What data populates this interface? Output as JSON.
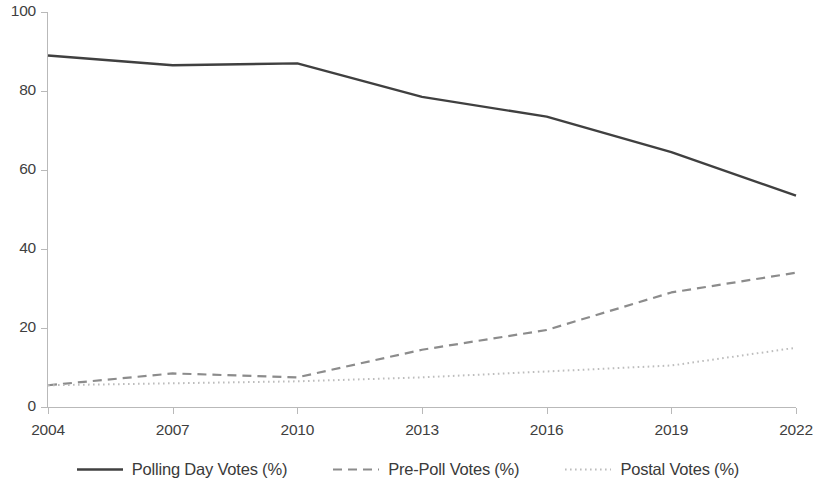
{
  "chart_data": {
    "type": "line",
    "title": "",
    "subtitle": "",
    "xlabel": "",
    "ylabel": "",
    "x": [
      2004,
      2007,
      2010,
      2013,
      2016,
      2019,
      2022
    ],
    "categories": [
      "2004",
      "2007",
      "2010",
      "2013",
      "2016",
      "2019",
      "2022"
    ],
    "series": [
      {
        "name": "Polling Day Votes (%)",
        "values": [
          89,
          86.5,
          87,
          78.5,
          73.5,
          64.5,
          53.5
        ],
        "style": "solid",
        "color": "#404040"
      },
      {
        "name": "Pre-Poll Votes (%)",
        "values": [
          5.5,
          8.5,
          7.5,
          14.5,
          19.5,
          29,
          34
        ],
        "style": "dashed",
        "color": "#8c8c8c"
      },
      {
        "name": "Postal Votes (%)",
        "values": [
          5.5,
          6,
          6.5,
          7.5,
          9,
          10.5,
          15
        ],
        "style": "dotted",
        "color": "#bdbdbd"
      }
    ],
    "ylim": [
      0,
      100
    ],
    "yticks": [
      0,
      20,
      40,
      60,
      80,
      100
    ],
    "ytick_labels": [
      "0",
      "20",
      "40",
      "60",
      "80",
      "100"
    ],
    "xlim": [
      2004,
      2022
    ],
    "xticks": [
      2004,
      2007,
      2010,
      2013,
      2016,
      2019,
      2022
    ],
    "grid": false,
    "legend_position": "bottom"
  },
  "axes": {
    "y_ticks": [
      {
        "label": "100",
        "value": 100
      },
      {
        "label": "80",
        "value": 80
      },
      {
        "label": "60",
        "value": 60
      },
      {
        "label": "40",
        "value": 40
      },
      {
        "label": "20",
        "value": 20
      },
      {
        "label": "0",
        "value": 0
      }
    ],
    "x_ticks": [
      {
        "label": "2004",
        "value": 2004
      },
      {
        "label": "2007",
        "value": 2007
      },
      {
        "label": "2010",
        "value": 2010
      },
      {
        "label": "2013",
        "value": 2013
      },
      {
        "label": "2016",
        "value": 2016
      },
      {
        "label": "2019",
        "value": 2019
      },
      {
        "label": "2022",
        "value": 2022
      }
    ]
  },
  "legend": {
    "items": [
      {
        "label": "Polling Day Votes (%)",
        "style": "solid",
        "color": "#404040"
      },
      {
        "label": "Pre-Poll Votes (%)",
        "style": "dashed",
        "color": "#8c8c8c"
      },
      {
        "label": "Postal Votes (%)",
        "style": "dotted",
        "color": "#bdbdbd"
      }
    ]
  },
  "colors": {
    "axis": "#b9b9b9",
    "text": "#3a3a3a",
    "background": "#ffffff"
  }
}
